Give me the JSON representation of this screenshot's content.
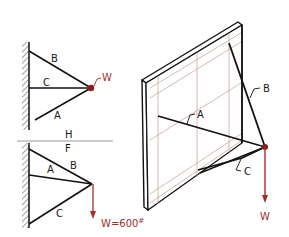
{
  "colors": {
    "ink": "#111111",
    "load": "#a0302a",
    "grid": "#c79a94",
    "hatch": "#444444",
    "divider": "#9a9a9a"
  },
  "top_left_figure": {
    "members": [
      "B",
      "C",
      "A"
    ],
    "load_label": "W"
  },
  "divider": {
    "label_above": "H",
    "label_below": "F"
  },
  "bottom_left_figure": {
    "members": [
      "B",
      "A",
      "C"
    ],
    "load_label": "W=600",
    "load_unit": "#"
  },
  "iso_figure": {
    "members": [
      "A",
      "B",
      "C"
    ],
    "load_label": "W"
  }
}
